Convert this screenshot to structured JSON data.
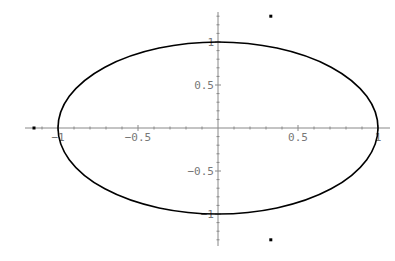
{
  "chart_data": {
    "type": "line",
    "title": "",
    "xlabel": "",
    "ylabel": "",
    "xlim": [
      -1.15,
      1.05
    ],
    "ylim": [
      -1.35,
      1.35
    ],
    "grid": false,
    "legend": null,
    "x_ticks": [
      {
        "value": -1,
        "label": "-1"
      },
      {
        "value": -0.5,
        "label": "-0.5"
      },
      {
        "value": 0.5,
        "label": "0.5"
      },
      {
        "value": 1,
        "label": "1"
      }
    ],
    "y_ticks": [
      {
        "value": 1,
        "label": "1"
      },
      {
        "value": 0.5,
        "label": "0.5"
      },
      {
        "value": -0.5,
        "label": "-0.5"
      },
      {
        "value": -1,
        "label": "-1"
      }
    ],
    "series": [
      {
        "name": "ellipse",
        "kind": "curve",
        "equation": "x^2 + y^2 = 1",
        "center": [
          0,
          0
        ],
        "rx": 1,
        "ry": 1,
        "color": "#000000"
      },
      {
        "name": "points",
        "kind": "scatter",
        "points": [
          {
            "x": -1.15,
            "y": 0
          },
          {
            "x": 0.33,
            "y": 1.3
          },
          {
            "x": 0.33,
            "y": -1.3
          }
        ],
        "color": "#000000"
      }
    ]
  },
  "colors": {
    "axis": "#888888",
    "curve": "#000000",
    "tick_label": "#777777"
  }
}
